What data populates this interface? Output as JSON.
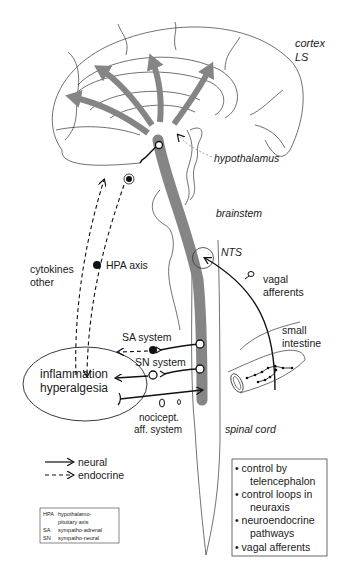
{
  "labels": {
    "cortex": "cortex",
    "ls": "LS",
    "hypothalamus": "hypothalamus",
    "brainstem": "brainstem",
    "nts": "NTS",
    "vagal_1": "vagal",
    "vagal_2": "afferents",
    "small_1": "small",
    "small_2": "intestine",
    "cytokines": "cytokines",
    "other": "other",
    "hpa_axis": "HPA axis",
    "sa_system": "SA system",
    "sn_system": "SN system",
    "inflammation": "inflammation",
    "hyperalgesia": "hyperalgesia",
    "nocicept_1": "nocicept.",
    "nocicept_2": "aff. system",
    "spinal_cord": "spinal cord"
  },
  "legend": {
    "neural": "neural",
    "endocrine": "endocrine"
  },
  "abbreviations": [
    {
      "abbr": "HPA",
      "text": "hypothalamo-"
    },
    {
      "abbr": "",
      "text": "pituitary axis"
    },
    {
      "abbr": "SA",
      "text": "sympatho-adrenal"
    },
    {
      "abbr": "SN",
      "text": "sympatho-neural"
    }
  ],
  "bullets": [
    {
      "line1": "• control by",
      "line2": "telencephalon"
    },
    {
      "line1": "• control loops in",
      "line2": "neuraxis"
    },
    {
      "line1": "• neuroendocrine",
      "line2": "pathways"
    },
    {
      "line1": "• vagal afferents",
      "line2": ""
    }
  ],
  "colors": {
    "pathway_gray": "#858585",
    "ink": "#111111"
  }
}
